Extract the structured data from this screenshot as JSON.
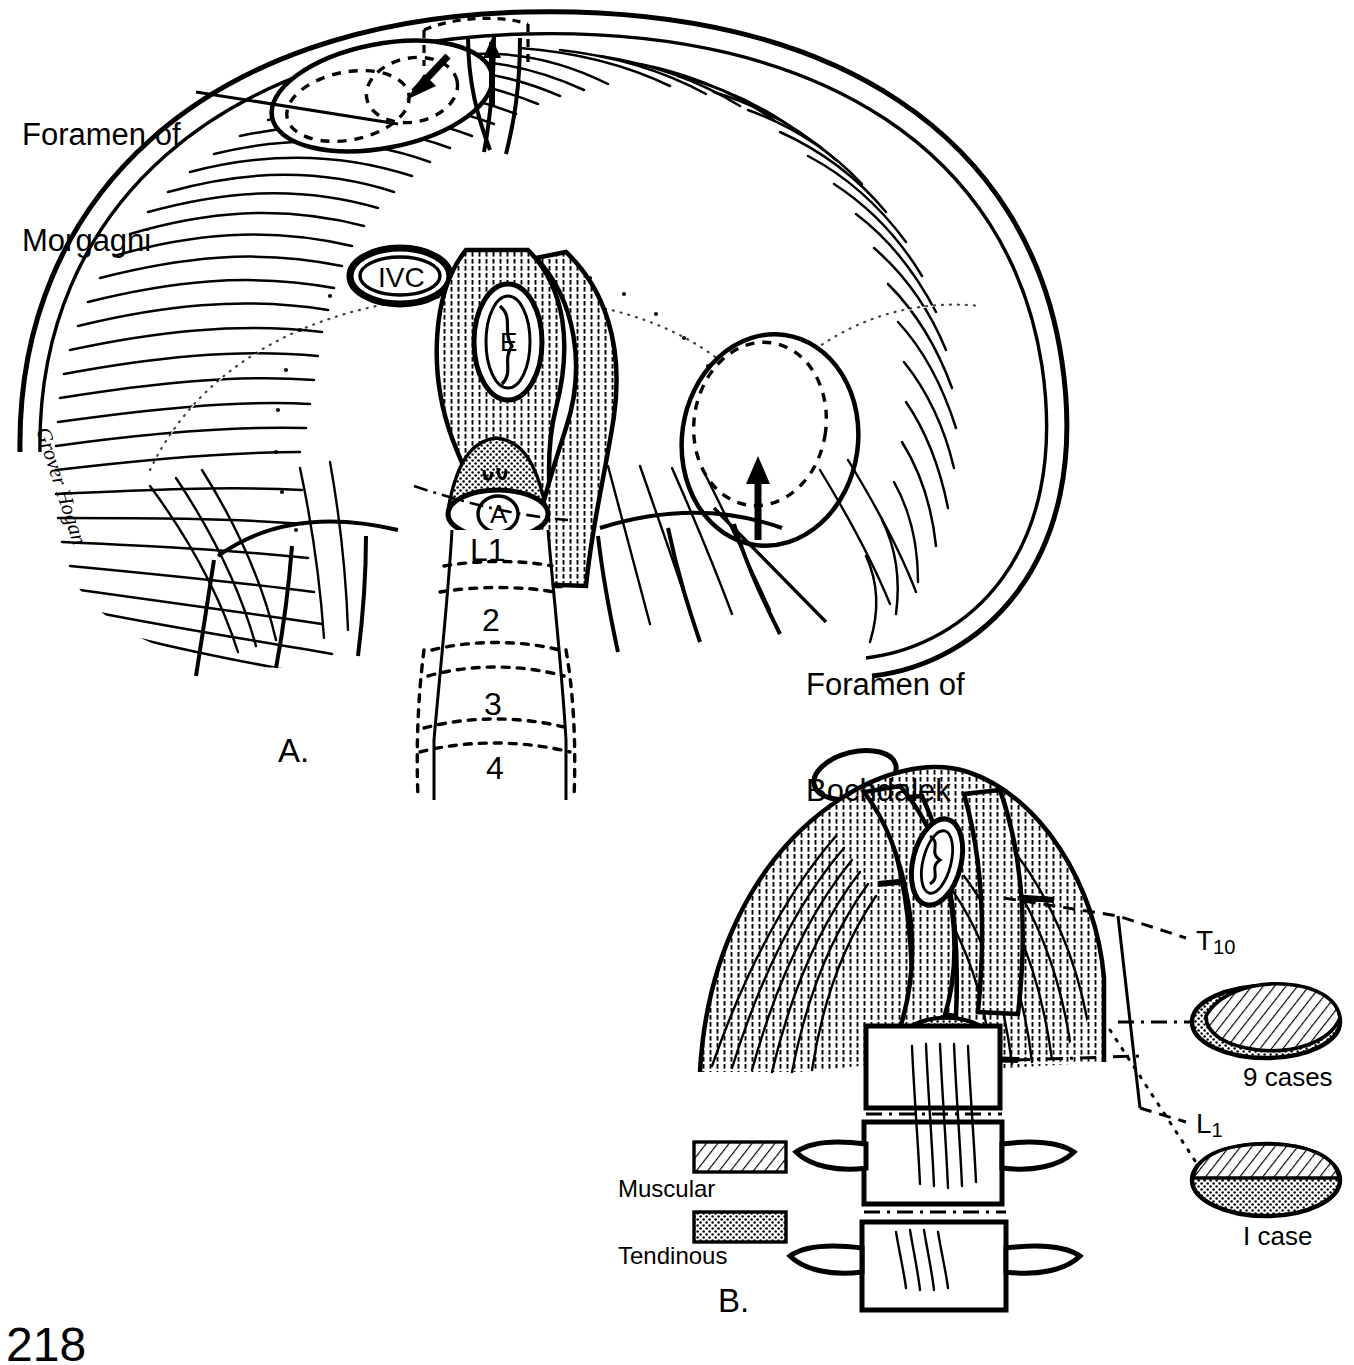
{
  "figure": {
    "page_number": "218",
    "artist_signature": "Grover Hogan",
    "ink_color": "#000000",
    "background_color": "#ffffff"
  },
  "panel_a": {
    "label": "A.",
    "caption_left": {
      "line1": "Foramen of",
      "line2": "Morgagni"
    },
    "caption_right": {
      "line1": "Foramen of",
      "line2": "Bochdalek"
    },
    "structures": {
      "ivc": "IVC",
      "esophagus": "E",
      "aorta": "A"
    },
    "vertebrae": [
      {
        "label": "L1"
      },
      {
        "label": "2"
      },
      {
        "label": "3"
      },
      {
        "label": "4"
      }
    ]
  },
  "panel_b": {
    "label": "B.",
    "level_labels": [
      {
        "main": "T",
        "sub": "10"
      },
      {
        "main": "L",
        "sub": "1"
      }
    ],
    "case_insets": [
      {
        "caption": "9 cases",
        "fill": "muscular-over-tendinous"
      },
      {
        "caption": "I case",
        "fill": "muscular-over-tendinous"
      }
    ],
    "legend": [
      {
        "label": "Muscular",
        "pattern": "diagonal-hatch"
      },
      {
        "label": "Tendinous",
        "pattern": "stipple-dots"
      }
    ]
  }
}
